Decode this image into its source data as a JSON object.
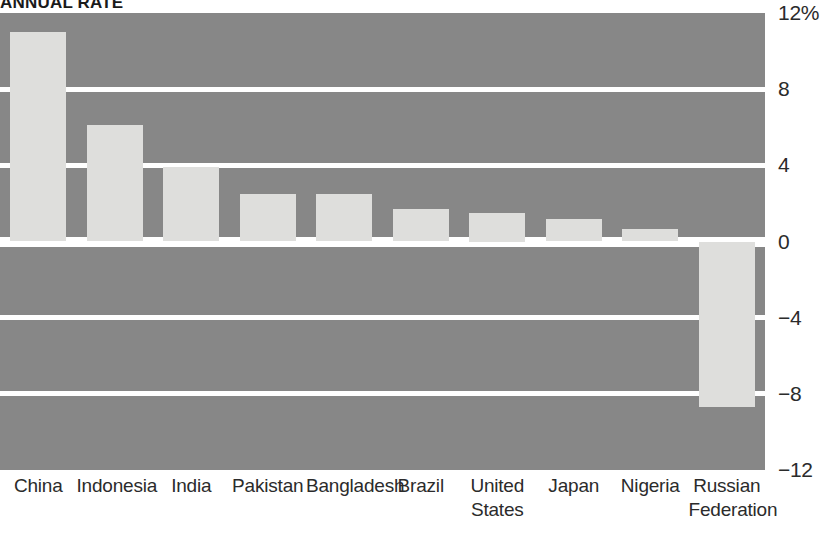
{
  "chart_data": {
    "type": "bar",
    "title": "ANNUAL RATE",
    "xlabel": "",
    "ylabel": "",
    "ylim": [
      -12,
      12
    ],
    "grid": true,
    "legend": "none",
    "unit": "%",
    "categories": [
      "China",
      "Indonesia",
      "India",
      "Pakistan",
      "Bangladesh",
      "Brazil",
      "United States",
      "Japan",
      "Nigeria",
      "Russian Federation"
    ],
    "category_lines": [
      [
        "China"
      ],
      [
        "Indonesia"
      ],
      [
        "India"
      ],
      [
        "Pakistan"
      ],
      [
        "Bangladesh"
      ],
      [
        "Brazil"
      ],
      [
        "United",
        "States"
      ],
      [
        "Japan"
      ],
      [
        "Nigeria"
      ],
      [
        "Russian",
        "Federation"
      ]
    ],
    "values": [
      11.0,
      6.1,
      3.9,
      2.5,
      2.5,
      1.7,
      1.5,
      1.2,
      0.65,
      -8.7
    ],
    "y_ticks": [
      12,
      8,
      4,
      0,
      -4,
      -8,
      -12
    ],
    "y_tick_labels": [
      "12%",
      "8",
      "4",
      "0",
      "−4",
      "−8",
      "−12"
    ],
    "colors": {
      "plot_background": "#878787",
      "bar_fill": "#dededc",
      "gridline": "#ffffff",
      "text": "#2b2b2b",
      "title_text": "#1a1a1a",
      "page_background": "#ffffff"
    }
  }
}
